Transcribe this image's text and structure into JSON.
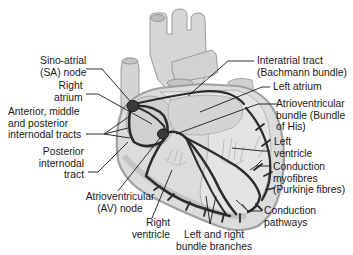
{
  "diagram": {
    "colors": {
      "background": "#ffffff",
      "heart_fill": "#d9d9d9",
      "heart_outline": "#9a9a9a",
      "vessel_fill": "#cfcfcf",
      "pathway": "#2b2b2b",
      "leader": "#1a1a1a",
      "text": "#1a1a1a"
    },
    "labels": {
      "sa_node": [
        "Sino-atrial",
        "(SA) node"
      ],
      "right_atrium": [
        "Right",
        "atrium"
      ],
      "internodal_tracts": [
        "Anterior, middle",
        "and posterior",
        "internodal tracts"
      ],
      "posterior_internodal": [
        "Posterior",
        "internodal",
        "tract"
      ],
      "av_node": [
        "Atrioventricular",
        "(AV) node"
      ],
      "right_ventricle": [
        "Right",
        "ventricle"
      ],
      "bundle_branches": [
        "Left and right",
        "bundle branches"
      ],
      "interatrial_tract": [
        "Interatrial tract",
        "(Bachmann bundle)"
      ],
      "left_atrium": [
        "Left atrium"
      ],
      "bundle_of_his": [
        "Atrioventricular",
        "bundle (Bundle",
        "of His)"
      ],
      "left_ventricle": [
        "Left",
        "ventricle"
      ],
      "purkinje": [
        "Conduction",
        "myofibres",
        "(Purkinje fibres)"
      ],
      "conduction_pathways": [
        "Conduction",
        "pathways"
      ]
    }
  }
}
